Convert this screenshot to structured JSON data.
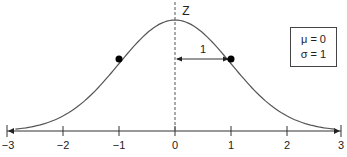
{
  "diagram": {
    "axis_label": "Z",
    "ticks": [
      "-3",
      "−2",
      "−1",
      "0",
      "1",
      "2",
      "3"
    ],
    "tick_display": [
      "−3",
      "−2",
      "−1",
      "0",
      "1",
      "2",
      "3"
    ],
    "distance_label": "1",
    "legend": {
      "mu": "μ = 0",
      "sigma": "σ = 1"
    },
    "marked_points": [
      -1,
      1
    ]
  }
}
